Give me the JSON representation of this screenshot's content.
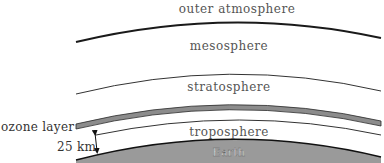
{
  "diagram": {
    "layers": [
      {
        "id": "outer",
        "label": "outer atmosphere"
      },
      {
        "id": "meso",
        "label": "mesosphere"
      },
      {
        "id": "strato",
        "label": "stratosphere"
      },
      {
        "id": "tropo",
        "label": "troposphere"
      },
      {
        "id": "earth",
        "label": "Earth"
      }
    ],
    "annotations": {
      "ozone_label": "ozone layer",
      "height_label": "25 km"
    },
    "colors": {
      "earth_fill": "#9a9a9a",
      "ozone_fill": "#8c8c8c",
      "line": "#222222"
    }
  }
}
